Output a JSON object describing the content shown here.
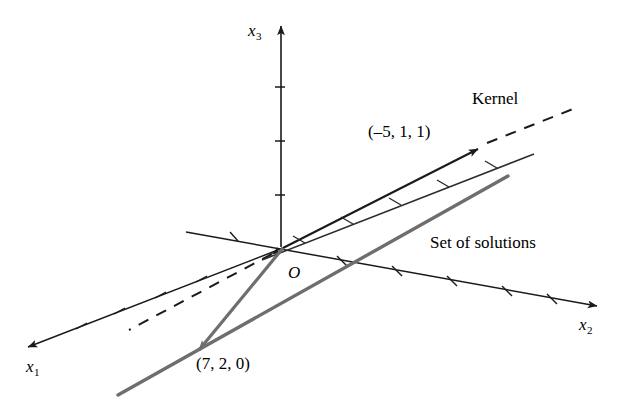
{
  "figure": {
    "type": "vector-space-diagram",
    "title_visible": false,
    "background_color": "#ffffff",
    "colors": {
      "axis": "#1a1a1a",
      "kernel_line": "#1a1a1a",
      "kernel_dashed": "#1a1a1a",
      "hatched_line": "#2b2b2b",
      "solution_line": "#6e6e6e",
      "solution_vector": "#6e6e6e",
      "text": "#000000"
    },
    "axes": [
      {
        "id": "x1",
        "label": "x",
        "subscript": "1",
        "direction": "down-left",
        "arrow": true,
        "hatch_marks": 4
      },
      {
        "id": "x2",
        "label": "x",
        "subscript": "2",
        "direction": "right-down",
        "arrow": true,
        "hatch_marks": 5
      },
      {
        "id": "x3",
        "label": "x",
        "subscript": "3",
        "direction": "up",
        "arrow": true,
        "hatch_marks": 3
      }
    ],
    "origin": {
      "label": "O"
    },
    "annotations": [
      {
        "id": "kernel",
        "text": "Kernel"
      },
      {
        "id": "set-of-solutions",
        "text": "Set of solutions"
      }
    ],
    "vectors": [
      {
        "id": "kernel-basis",
        "label": "(–5, 1, 1)",
        "components": [
          -5,
          1,
          1
        ],
        "style": "solid-black-arrow"
      },
      {
        "id": "particular-solution",
        "label": "(7, 2, 0)",
        "components": [
          7,
          2,
          0
        ],
        "style": "solid-gray-arrow"
      }
    ],
    "lines": [
      {
        "id": "kernel-line",
        "style": "solid-then-dashed",
        "description": "kernel through origin"
      },
      {
        "id": "hatched-parallel-line",
        "style": "solid-hatched",
        "description": "hatched guide line"
      },
      {
        "id": "solution-line",
        "style": "thick-gray",
        "description": "affine set of solutions"
      }
    ]
  },
  "labels": {
    "x1": "x",
    "x1_sub": "1",
    "x2": "x",
    "x2_sub": "2",
    "x3": "x",
    "x3_sub": "3",
    "origin": "O",
    "kernel": "Kernel",
    "set_of_solutions": "Set of solutions",
    "kernel_vector": "(–5, 1, 1)",
    "solution_vector": "(7, 2, 0)"
  }
}
